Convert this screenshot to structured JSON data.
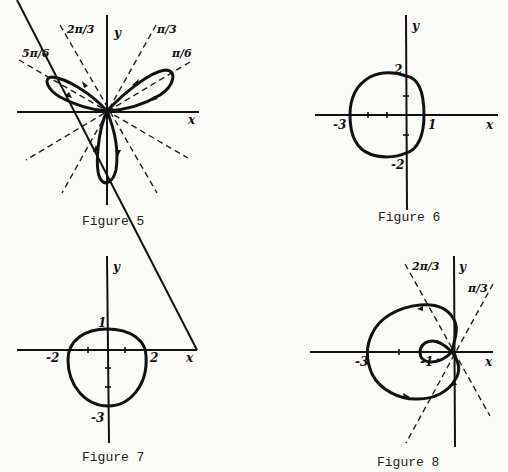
{
  "figures": [
    {
      "caption": "Figure 5",
      "axis_labels": {
        "x": "x",
        "y": "y"
      },
      "angle_labels": [
        "5π/6",
        "2π/3",
        "π/3",
        "π/6"
      ],
      "description": "Three-petal rose curve with petals along π/6, 5π/6 and -π/2; dashed lines at π/6, π/3, 2π/3, 5π/6"
    },
    {
      "caption": "Figure 6",
      "axis_labels": {
        "x": "x",
        "y": "y"
      },
      "tick_labels": {
        "x_left": "-3",
        "x_right": "1",
        "y_top": "2",
        "y_bottom": "-2"
      },
      "description": "Limaçon without inner loop (dimpled), r = 2 - cos θ style"
    },
    {
      "caption": "Figure 7",
      "axis_labels": {
        "x": "x",
        "y": "y"
      },
      "tick_labels": {
        "x_left": "-2",
        "x_right": "2",
        "y_top": "1",
        "y_bottom": "-3"
      },
      "description": "Circle-like closed curve crossing y at 1 and -3, x at -2 and 2"
    },
    {
      "caption": "Figure 8",
      "axis_labels": {
        "x": "x",
        "y": "y"
      },
      "tick_labels": {
        "x_outer": "-3",
        "x_inner": "-1"
      },
      "angle_labels": [
        "2π/3",
        "π/3"
      ],
      "description": "Limaçon with inner loop; dashed lines at π/3 and 2π/3"
    }
  ]
}
